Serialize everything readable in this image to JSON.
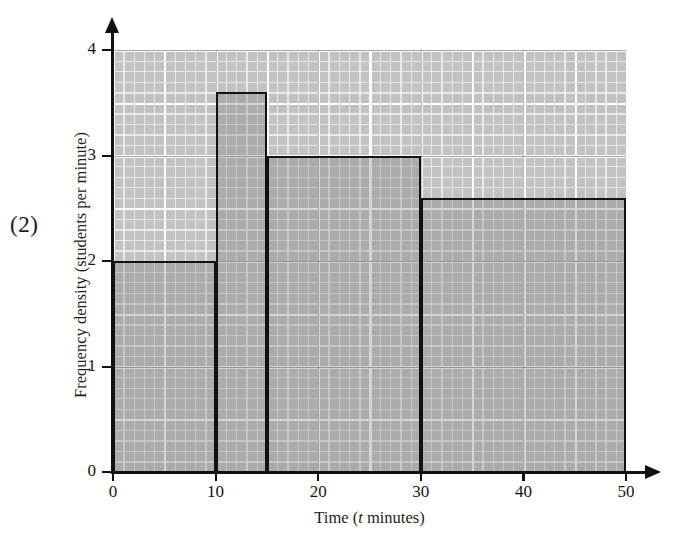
{
  "marks": {
    "label": "(2)"
  },
  "chart_data": {
    "type": "bar",
    "title": "",
    "subtitle": "",
    "xlabel_prefix": "Time (",
    "xlabel_italic": "t",
    "xlabel_suffix": " minutes)",
    "xlabel": "Time (t minutes)",
    "ylabel": "Frequency density (students per minute)",
    "xlim": [
      0,
      50
    ],
    "ylim": [
      0,
      4
    ],
    "grid": true,
    "legend": null,
    "x_ticks": [
      0,
      10,
      20,
      30,
      40,
      50
    ],
    "x_tick_labels": [
      "0",
      "10",
      "20",
      "30",
      "40",
      "50"
    ],
    "y_ticks": [
      0,
      1,
      2,
      3,
      4
    ],
    "y_tick_labels": [
      "0",
      "1",
      "2",
      "3",
      "4"
    ],
    "bars": [
      {
        "label": "0 < t ≤ 10",
        "x_start": 0,
        "x_end": 10,
        "width": 10,
        "value": 2.0,
        "frequency": 20
      },
      {
        "label": "10 < t ≤ 15",
        "x_start": 10,
        "x_end": 15,
        "width": 5,
        "value": 3.6,
        "frequency": 18
      },
      {
        "label": "15 < t ≤ 30",
        "x_start": 15,
        "x_end": 30,
        "width": 15,
        "value": 3.0,
        "frequency": 45
      },
      {
        "label": "30 < t ≤ 50",
        "x_start": 30,
        "x_end": 50,
        "width": 20,
        "value": 2.6,
        "frequency": 52
      }
    ],
    "categories": [
      "0-10",
      "10-15",
      "15-30",
      "30-50"
    ],
    "values": [
      2.0,
      3.6,
      3.0,
      2.6
    ]
  },
  "colors": {
    "grid_background": "#c2c2c2",
    "grid_line": "#ffffff",
    "bar_outline": "#111111",
    "bar_fill": "rgba(120,120,120,0.30)",
    "axis": "#111111",
    "text": "#1a1a1a",
    "page_background": "#ffffff"
  }
}
